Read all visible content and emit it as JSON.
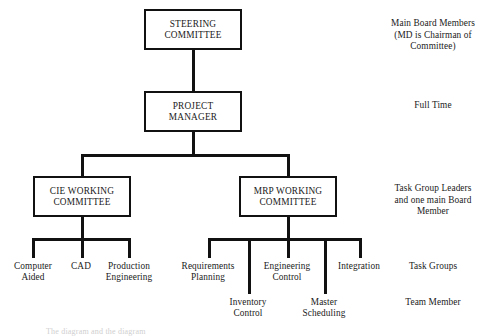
{
  "diagram": {
    "nodes": {
      "steering_committee": "STEERING\nCOMMITTEE",
      "project_manager": "PROJECT\nMANAGER",
      "cie_working_committee": "CIE WORKING\nCOMMITTEE",
      "mrp_working_committee": "MRP WORKING\nCOMMITTEE"
    },
    "cie_task_groups": [
      {
        "label": "Computer\nAided"
      },
      {
        "label": "CAD"
      },
      {
        "label": "Production\nEngineering"
      }
    ],
    "mrp_task_groups": [
      {
        "label": "Requirements\nPlanning"
      },
      {
        "label": "Engineering\nControl"
      },
      {
        "label": "Integration"
      }
    ],
    "mrp_team_members": [
      {
        "label": "Inventory\nControl"
      },
      {
        "label": "Master\nScheduling"
      }
    ],
    "annotations": [
      {
        "id": "steering",
        "text": "Main Board Members\n(MD is Chairman of\nCommittee)"
      },
      {
        "id": "project-manager",
        "text": "Full Time"
      },
      {
        "id": "working-committees",
        "text": "Task Group Leaders\nand one main Board\nMember"
      },
      {
        "id": "task-groups",
        "text": "Task Groups"
      },
      {
        "id": "team-member",
        "text": "Team Member"
      }
    ],
    "caption": "The diagram and the diagram",
    "colors": {
      "line": "#111111",
      "box_border": "#111111",
      "background": "#ffffff",
      "text": "#1a1a1a"
    }
  }
}
